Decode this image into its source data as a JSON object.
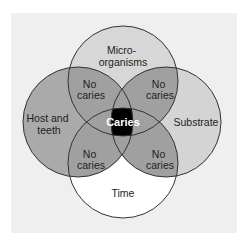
{
  "diagram": {
    "type": "venn",
    "sets": [
      {
        "id": "microorganisms",
        "label_lines": [
          "Micro-",
          "organisms"
        ],
        "fill": "#d7d7d7"
      },
      {
        "id": "host",
        "label_lines": [
          "Host and",
          "teeth"
        ],
        "fill": "#aaaaaa"
      },
      {
        "id": "substrate",
        "label_lines": [
          "Substrate"
        ],
        "fill": "#d4d4d4"
      },
      {
        "id": "time",
        "label_lines": [
          "Time"
        ],
        "fill": "#ffffff"
      }
    ],
    "overlaps": {
      "top_left": [
        "No",
        "caries"
      ],
      "top_right": [
        "No",
        "caries"
      ],
      "bottom_left": [
        "No",
        "caries"
      ],
      "bottom_right": [
        "No",
        "caries"
      ],
      "center": "Caries"
    },
    "colors": {
      "background": "#ffffff",
      "panel": "#efefef",
      "overlap": "#a0a0a0",
      "center": "#000000",
      "stroke": "#333333"
    }
  }
}
